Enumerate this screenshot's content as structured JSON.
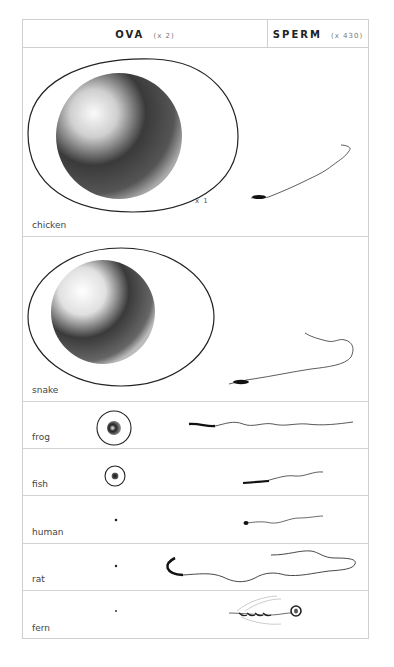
{
  "header": {
    "ova_title": "OVA",
    "ova_scale": "(x 2)",
    "sperm_title": "SPERM",
    "sperm_scale": "(x 430)"
  },
  "rows": [
    {
      "label": "chicken",
      "ovum": "large shaded yolk inside egg outline",
      "magnification_note": "x 1"
    },
    {
      "label": "snake",
      "ovum": "large shaded yolk inside oval egg outline"
    },
    {
      "label": "frog",
      "ovum": "small shaded sphere in circle"
    },
    {
      "label": "fish",
      "ovum": "tiny shaded sphere in circle"
    },
    {
      "label": "human",
      "ovum": "dot"
    },
    {
      "label": "rat",
      "ovum": "dot"
    },
    {
      "label": "fern",
      "ovum": "dot"
    }
  ],
  "colors": {
    "border": "#cfcfcf",
    "ink": "#222222",
    "text": "#444444"
  }
}
